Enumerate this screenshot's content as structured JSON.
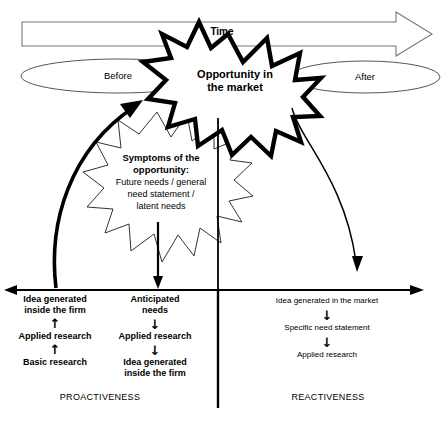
{
  "diagram": {
    "time_axis": {
      "label": "Time"
    },
    "phases": {
      "before": "Before",
      "after": "After"
    },
    "bursts": {
      "outer": {
        "line1": "Opportunity in",
        "line2": "the market"
      },
      "inner": {
        "heading1": "Symptoms of the",
        "heading2": "opportunity:",
        "body1": "Future needs / general",
        "body2": "need statement /",
        "body3": "latent needs"
      }
    },
    "columns": [
      {
        "id": "proactive-left",
        "direction": "up",
        "steps": [
          "Idea generated\ninside the firm",
          "Applied research",
          "Basic research"
        ],
        "step1_line1": "Idea generated",
        "step1_line2": "inside the firm",
        "step2": "Applied research",
        "step3": "Basic research"
      },
      {
        "id": "proactive-middle",
        "direction": "down",
        "step1_line1": "Anticipated",
        "step1_line2": "needs",
        "step2": "Applied research",
        "step3_line1": "Idea generated",
        "step3_line2": "inside the firm"
      },
      {
        "id": "reactive-right",
        "direction": "down",
        "step1": "Idea generated in the market",
        "step2": "Specific need statement",
        "step3": "Applied research"
      }
    ],
    "footer": {
      "left": "PROACTIVENESS",
      "right": "REACTIVENESS"
    },
    "arrow_glyphs": {
      "up": "↑",
      "down": "↓"
    },
    "colors": {
      "stroke": "#000000",
      "light_stroke": "#555555",
      "background": "#ffffff",
      "caption": "#b9b9b9"
    }
  }
}
